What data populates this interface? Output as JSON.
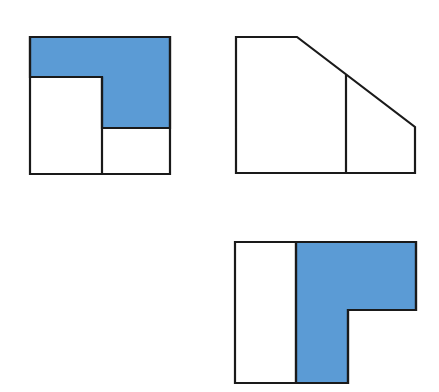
{
  "diagram": {
    "type": "orthographic-three-views",
    "colors": {
      "fill": "#5b9bd5",
      "stroke": "#1a1a1a",
      "background": "#ffffff",
      "face": "#ffffff"
    },
    "stroke_width": 2.2,
    "views": [
      {
        "name": "front-view",
        "position": "top-left",
        "outline": [
          [
            30,
            37
          ],
          [
            170,
            37
          ],
          [
            170,
            174
          ],
          [
            30,
            174
          ]
        ],
        "shaded": [
          [
            30,
            37
          ],
          [
            170,
            37
          ],
          [
            170,
            128
          ],
          [
            102,
            128
          ],
          [
            102,
            77
          ],
          [
            30,
            77
          ]
        ],
        "lines": [
          [
            [
              102,
              77
            ],
            [
              102,
              174
            ]
          ],
          [
            [
              102,
              128
            ],
            [
              170,
              128
            ]
          ],
          [
            [
              30,
              77
            ],
            [
              102,
              77
            ]
          ]
        ]
      },
      {
        "name": "side-view",
        "position": "top-right",
        "outline": [
          [
            236,
            37
          ],
          [
            297,
            37
          ],
          [
            415,
            127
          ],
          [
            415,
            173
          ],
          [
            236,
            173
          ]
        ],
        "shaded": [],
        "lines": [
          [
            [
              346,
              75
            ],
            [
              346,
              173
            ]
          ]
        ]
      },
      {
        "name": "top-view",
        "position": "bottom-right",
        "outline": [
          [
            235,
            242
          ],
          [
            416,
            242
          ],
          [
            416,
            310
          ],
          [
            348,
            310
          ],
          [
            348,
            383
          ],
          [
            235,
            383
          ]
        ],
        "shaded": [
          [
            296,
            242
          ],
          [
            416,
            242
          ],
          [
            416,
            310
          ],
          [
            348,
            310
          ],
          [
            348,
            383
          ],
          [
            296,
            383
          ]
        ],
        "lines": [
          [
            [
              296,
              242
            ],
            [
              296,
              383
            ]
          ]
        ]
      }
    ]
  }
}
